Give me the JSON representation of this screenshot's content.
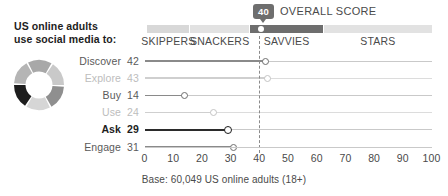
{
  "header": {
    "title_line1": "US online adults",
    "title_line2": "use social media to:",
    "overall_score_label": "OVERALL SCORE",
    "overall_score_value": "40"
  },
  "segment_bar": {
    "segments": [
      {
        "name": "SKIPPERS",
        "label": "SKIPPERS",
        "start": 0,
        "end": 15,
        "color": "#d8d8d8"
      },
      {
        "name": "SNACKERS",
        "label": "SNACKERS",
        "start": 15,
        "end": 36,
        "color": "#e2e2e2"
      },
      {
        "name": "SAVVIES",
        "label": "SAVVIES",
        "start": 36,
        "end": 62,
        "color": "#6e6e6e"
      },
      {
        "name": "STARS",
        "label": "STARS",
        "start": 62,
        "end": 100,
        "color": "#e2e2e2"
      }
    ],
    "marker_value": 40
  },
  "donut": {
    "segments": [
      {
        "label": "Discover",
        "value": 42,
        "color": "#a8a8a8"
      },
      {
        "label": "Explore",
        "value": 43,
        "color": "#c9c9c9"
      },
      {
        "label": "Buy",
        "value": 14,
        "color": "#8f8f8f"
      },
      {
        "label": "Use",
        "value": 24,
        "color": "#d6d6d6"
      },
      {
        "label": "Ask",
        "value": 29,
        "color": "#1d1d1d"
      },
      {
        "label": "Engage",
        "value": 31,
        "color": "#b5b5b5"
      }
    ]
  },
  "chart_data": {
    "type": "bar",
    "title": "US online adults use social media to:",
    "subtitle": "OVERALL SCORE 40",
    "xlabel": "",
    "ylabel": "",
    "xlim": [
      0,
      100
    ],
    "categories": [
      "Discover",
      "Explore",
      "Buy",
      "Use",
      "Ask",
      "Engage"
    ],
    "values": [
      42,
      43,
      14,
      24,
      29,
      31
    ],
    "emphasis": [
      "normal",
      "dim",
      "normal",
      "dim",
      "bold",
      "normal"
    ],
    "xticks": [
      "0",
      "10",
      "20",
      "30",
      "40",
      "50",
      "60",
      "70",
      "80",
      "90",
      "100"
    ],
    "reference_line": 40,
    "grid": false,
    "legend": "none",
    "rows": [
      {
        "label": "Discover",
        "value": "42",
        "num": 42,
        "style": "norm"
      },
      {
        "label": "Explore",
        "value": "43",
        "num": 43,
        "style": "dim"
      },
      {
        "label": "Buy",
        "value": "14",
        "num": 14,
        "style": "norm"
      },
      {
        "label": "Use",
        "value": "24",
        "num": 24,
        "style": "dim"
      },
      {
        "label": "Ask",
        "value": "29",
        "num": 29,
        "style": "bold"
      },
      {
        "label": "Engage",
        "value": "31",
        "num": 31,
        "style": "norm"
      }
    ]
  },
  "footer": {
    "base_note": "Base: 60,049 US online adults (18+)"
  },
  "colors": {
    "accent_dark": "#6e6e6e",
    "emphasis": "#1d1d1d",
    "track": "#c9c9c9",
    "dim": "#bdbdbd"
  }
}
